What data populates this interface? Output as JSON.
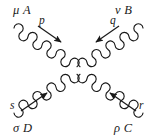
{
  "figure": {
    "name": "four-gluon-vertex-feynman-diagram",
    "type": "feynman-diagram",
    "background_color": "#ffffff",
    "ink_color": "#1a1a1a",
    "width": 157,
    "height": 140,
    "vertex": {
      "x": 78,
      "y": 70
    }
  },
  "legs": [
    {
      "id": "upper-left",
      "leg_label": "μ A",
      "lorentz_index": "μ",
      "color_index": "A",
      "momentum_label": "p",
      "momentum_direction": "incoming",
      "arrow_from": {
        "x": 38,
        "y": 27
      },
      "arrow_to": {
        "x": 64,
        "y": 45
      },
      "coil_start": {
        "x": 14,
        "y": 28
      },
      "coil_end": {
        "x": 78,
        "y": 70
      },
      "coil_loops": 9
    },
    {
      "id": "upper-right",
      "leg_label": "ν B",
      "lorentz_index": "ν",
      "color_index": "B",
      "momentum_label": "q",
      "momentum_direction": "incoming",
      "arrow_from": {
        "x": 118,
        "y": 27
      },
      "arrow_to": {
        "x": 92,
        "y": 45
      },
      "coil_start": {
        "x": 143,
        "y": 28
      },
      "coil_end": {
        "x": 78,
        "y": 70
      },
      "coil_loops": 9
    },
    {
      "id": "lower-left",
      "leg_label": "σ D",
      "lorentz_index": "σ",
      "color_index": "D",
      "momentum_label": "s",
      "momentum_direction": "incoming",
      "arrow_from": {
        "x": 22,
        "y": 111
      },
      "arrow_to": {
        "x": 50,
        "y": 91
      },
      "coil_start": {
        "x": 14,
        "y": 113
      },
      "coil_end": {
        "x": 78,
        "y": 70
      },
      "coil_loops": 9
    },
    {
      "id": "lower-right",
      "leg_label": "ρ C",
      "lorentz_index": "ρ",
      "color_index": "C",
      "momentum_label": "r",
      "momentum_direction": "incoming",
      "arrow_from": {
        "x": 135,
        "y": 111
      },
      "arrow_to": {
        "x": 107,
        "y": 91
      },
      "coil_start": {
        "x": 143,
        "y": 113
      },
      "coil_end": {
        "x": 78,
        "y": 70
      },
      "coil_loops": 9
    }
  ],
  "labels": {
    "mu_a": "μ A",
    "nu_b": "ν B",
    "sigma_d": "σ D",
    "rho_c": "ρ C",
    "p": "p",
    "q": "q",
    "s": "s",
    "r": "r"
  }
}
